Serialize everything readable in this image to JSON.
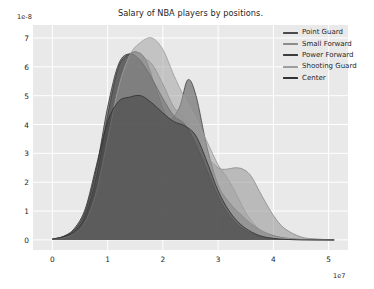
{
  "chart_data": {
    "type": "area",
    "title": "Salary of NBA players by positions.",
    "xlabel": "",
    "ylabel": "",
    "xlim": [
      -3500000,
      53500000
    ],
    "ylim": [
      -3.5e-09,
      7.45e-08
    ],
    "x_offset_text": "1e7",
    "y_offset_text": "1e-8",
    "x_tick_labels": [
      "0",
      "1",
      "2",
      "3",
      "4",
      "5"
    ],
    "x_tick_values": [
      0,
      10000000,
      20000000,
      30000000,
      40000000,
      50000000
    ],
    "y_tick_labels": [
      "0",
      "1",
      "2",
      "3",
      "4",
      "5",
      "6",
      "7"
    ],
    "y_tick_values": [
      0,
      1e-08,
      2e-08,
      3e-08,
      4e-08,
      5e-08,
      6e-08,
      7e-08
    ],
    "grid": true,
    "legend_position": "upper right",
    "plot_background": "#e9e9e9",
    "grid_color": "#ffffff",
    "x_unit_scale": 10000000,
    "y_unit_scale": 1e-08,
    "series": [
      {
        "name": "Point Guard",
        "color": "#4a4a4a",
        "fill_opacity": 0.55,
        "x": [
          0,
          2000000,
          4000000,
          6000000,
          8000000,
          10000000,
          12000000,
          14000000,
          15500000,
          17000000,
          19000000,
          21000000,
          23000000,
          24500000,
          26000000,
          28000000,
          30000000,
          32000000,
          34000000,
          36000000,
          38000000,
          40000000,
          42000000,
          45000000,
          48000000,
          51000000
        ],
        "y": [
          0.03,
          0.1,
          0.3,
          0.85,
          2.2,
          4.3,
          6.0,
          6.45,
          6.5,
          6.2,
          5.1,
          4.2,
          4.6,
          5.55,
          5.0,
          3.2,
          1.9,
          1.3,
          0.9,
          0.55,
          0.3,
          0.15,
          0.07,
          0.02,
          0.01,
          0.0
        ]
      },
      {
        "name": "Small Forward",
        "color": "#8c8c8c",
        "fill_opacity": 0.5,
        "x": [
          0,
          2000000,
          4000000,
          6000000,
          8000000,
          10000000,
          12000000,
          14000000,
          16000000,
          18000000,
          20000000,
          22000000,
          24000000,
          26000000,
          28000000,
          30000000,
          31500000,
          33000000,
          34500000,
          36000000,
          38000000,
          40000000,
          42000000,
          45000000,
          48000000,
          51000000
        ],
        "y": [
          0.02,
          0.08,
          0.25,
          0.7,
          1.8,
          3.6,
          5.2,
          6.0,
          6.3,
          6.1,
          5.4,
          4.6,
          4.2,
          3.6,
          2.9,
          2.5,
          2.45,
          2.5,
          2.45,
          2.2,
          1.5,
          0.85,
          0.4,
          0.1,
          0.03,
          0.0
        ]
      },
      {
        "name": "Power Forward",
        "color": "#3d3d3d",
        "fill_opacity": 0.55,
        "x": [
          0,
          2000000,
          4000000,
          6000000,
          8000000,
          10000000,
          12000000,
          14000000,
          16000000,
          18000000,
          20000000,
          22000000,
          24000000,
          26000000,
          28000000,
          30000000,
          32000000,
          34000000,
          36000000,
          38000000,
          40000000,
          42000000,
          45000000,
          48000000,
          51000000
        ],
        "y": [
          0.03,
          0.12,
          0.35,
          1.0,
          2.5,
          4.6,
          6.1,
          6.45,
          6.2,
          5.6,
          4.9,
          4.3,
          4.0,
          3.3,
          2.4,
          1.5,
          0.85,
          0.45,
          0.22,
          0.1,
          0.05,
          0.02,
          0.01,
          0.0,
          0.0
        ]
      },
      {
        "name": "Shooting Guard",
        "color": "#9e9e9e",
        "fill_opacity": 0.5,
        "x": [
          0,
          2000000,
          4000000,
          6000000,
          8000000,
          10000000,
          12000000,
          14000000,
          16000000,
          18000000,
          20000000,
          22000000,
          24000000,
          26000000,
          28000000,
          30000000,
          31500000,
          33000000,
          35000000,
          37000000,
          39000000,
          41000000,
          44000000,
          47000000,
          51000000
        ],
        "y": [
          0.02,
          0.07,
          0.22,
          0.65,
          1.7,
          3.5,
          5.3,
          6.4,
          6.85,
          7.0,
          6.6,
          5.7,
          4.9,
          4.2,
          3.4,
          2.6,
          2.2,
          1.7,
          0.95,
          0.45,
          0.2,
          0.08,
          0.02,
          0.01,
          0.0
        ]
      },
      {
        "name": "Center",
        "color": "#333333",
        "fill_opacity": 0.45,
        "x": [
          0,
          2000000,
          4000000,
          6000000,
          8000000,
          10000000,
          12000000,
          14000000,
          16000000,
          18000000,
          20000000,
          22000000,
          24000000,
          26000000,
          28000000,
          30000000,
          32000000,
          34000000,
          36000000,
          38000000,
          40000000,
          42000000,
          45000000,
          48000000,
          51000000
        ],
        "y": [
          0.03,
          0.12,
          0.4,
          1.1,
          2.6,
          4.1,
          4.8,
          4.95,
          5.0,
          4.75,
          4.4,
          4.1,
          3.95,
          3.6,
          2.7,
          1.7,
          1.0,
          0.55,
          0.28,
          0.12,
          0.05,
          0.02,
          0.0,
          0.0,
          0.0
        ]
      }
    ]
  },
  "legend": {
    "items": [
      {
        "label": "Point Guard",
        "color": "#4a4a4a"
      },
      {
        "label": "Small Forward",
        "color": "#8c8c8c"
      },
      {
        "label": "Power Forward",
        "color": "#3d3d3d"
      },
      {
        "label": "Shooting Guard",
        "color": "#9e9e9e"
      },
      {
        "label": "Center",
        "color": "#333333"
      }
    ]
  }
}
